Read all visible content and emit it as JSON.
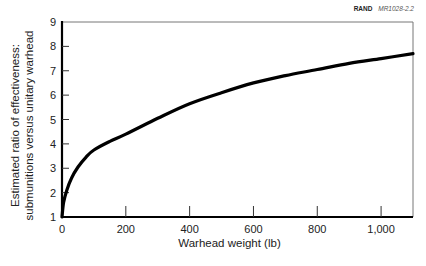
{
  "credit": {
    "org": "RAND",
    "code": "MR1028-2.2"
  },
  "chart_data": {
    "type": "line",
    "title": "",
    "xlabel": "Warhead weight (lb)",
    "ylabel_lines": [
      "Estimated ratio of effectiveness:",
      "submunitions versus unitary warhead"
    ],
    "xlim": [
      0,
      1100
    ],
    "ylim": [
      1,
      9
    ],
    "x_ticks": [
      0,
      200,
      400,
      600,
      800,
      1000
    ],
    "x_tick_labels": [
      "0",
      "200",
      "400",
      "600",
      "800",
      "1,000"
    ],
    "y_ticks": [
      1,
      2,
      3,
      4,
      5,
      6,
      7,
      8,
      9
    ],
    "y_tick_labels": [
      "1",
      "2",
      "3",
      "4",
      "5",
      "6",
      "7",
      "8",
      "9"
    ],
    "grid": false,
    "legend": null,
    "series": [
      {
        "name": "Effectiveness ratio",
        "x": [
          0,
          5,
          15,
          30,
          50,
          75,
          100,
          150,
          200,
          300,
          400,
          500,
          600,
          700,
          800,
          900,
          1000,
          1100
        ],
        "values": [
          1.0,
          1.6,
          2.1,
          2.6,
          3.05,
          3.45,
          3.75,
          4.1,
          4.4,
          5.05,
          5.65,
          6.1,
          6.5,
          6.8,
          7.05,
          7.3,
          7.5,
          7.7
        ]
      }
    ]
  }
}
